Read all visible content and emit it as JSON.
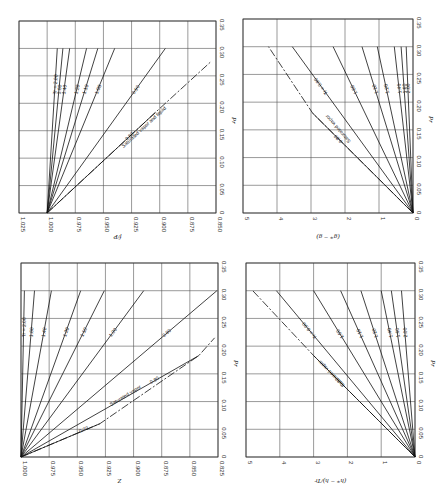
{
  "chart_data": [
    {
      "id": "fugacity",
      "type": "line",
      "orientation": "rotated-90",
      "box": {
        "x0": 19,
        "x1": 216,
        "y0": 21,
        "y1": 213
      },
      "value_axis": {
        "label": "f/P",
        "ticks": [
          "1.025",
          "1.000",
          "0.975",
          "0.950",
          "0.925",
          "0.900",
          "0.875",
          "0.850"
        ],
        "range": [
          1.025,
          0.85
        ]
      },
      "pressure_axis": {
        "label": "Pr",
        "ticks": [
          "0",
          "0.05",
          "0.10",
          "0.15",
          "0.20",
          "0.25",
          "0.30",
          "0.35"
        ],
        "range": [
          0,
          0.35
        ]
      },
      "series": [
        {
          "name": "Tr = 2.00",
          "end": [
            0.3,
            0.991
          ]
        },
        {
          "name": "1.60",
          "end": [
            0.3,
            0.986
          ]
        },
        {
          "name": "1.40",
          "end": [
            0.3,
            0.98
          ]
        },
        {
          "name": "1.20",
          "end": [
            0.3,
            0.965
          ]
        },
        {
          "name": "1.10",
          "end": [
            0.3,
            0.955
          ]
        },
        {
          "name": "1.00",
          "end": [
            0.3,
            0.94
          ]
        },
        {
          "name": "0.90",
          "end": [
            0.3,
            0.895
          ]
        },
        {
          "name": "0.80",
          "end": [
            0.183,
            0.904
          ]
        }
      ],
      "saturation": {
        "name": "Saturated vapor and liquid",
        "points": [
          [
            0,
            1.0
          ],
          [
            0.183,
            0.904
          ],
          [
            0.275,
            0.855
          ]
        ]
      }
    },
    {
      "id": "free-energy",
      "type": "line",
      "orientation": "rotated-90",
      "box": {
        "x0": 243,
        "x1": 413,
        "y0": 19,
        "y1": 213
      },
      "value_axis": {
        "label": "(g* − g)",
        "ticks": [
          "5",
          "4",
          "3",
          "2",
          "1",
          "0"
        ],
        "range": [
          5,
          0
        ]
      },
      "pressure_axis": {
        "label": "Pr",
        "ticks": [
          "0",
          "0.05",
          "0.10",
          "0.15",
          "0.20",
          "0.25",
          "0.30",
          "0.35"
        ],
        "range": [
          0,
          0.35
        ]
      },
      "series": [
        {
          "name": "2.00",
          "end": [
            0.3,
            0.2
          ]
        },
        {
          "name": "1.60",
          "end": [
            0.3,
            0.35
          ]
        },
        {
          "name": "1.40",
          "end": [
            0.3,
            0.55
          ]
        },
        {
          "name": "1.20",
          "end": [
            0.3,
            1.05
          ]
        },
        {
          "name": "1.10",
          "end": [
            0.3,
            1.5
          ]
        },
        {
          "name": "1.00",
          "end": [
            0.3,
            2.35
          ]
        },
        {
          "name": "Tr = 0.90",
          "end": [
            0.3,
            3.55
          ]
        },
        {
          "name": "0.80",
          "end": [
            0.18,
            2.95
          ]
        }
      ],
      "saturation": {
        "name": "Saturated vapor",
        "points": [
          [
            0,
            0
          ],
          [
            0.18,
            2.95
          ],
          [
            0.3,
            4.25
          ]
        ]
      }
    },
    {
      "id": "compressibility",
      "type": "line",
      "orientation": "rotated-90",
      "box": {
        "x0": 21,
        "x1": 218,
        "y0": 263,
        "y1": 457
      },
      "value_axis": {
        "label": "Z",
        "ticks": [
          "1.000",
          "0.975",
          "0.950",
          "0.925",
          "0.900",
          "0.875",
          "0.850",
          "0.825"
        ],
        "range": [
          1.0,
          0.825
        ]
      },
      "pressure_axis": {
        "label": "Pr",
        "ticks": [
          "0",
          "0.05",
          "0.10",
          "0.15",
          "0.20",
          "0.25",
          "0.30",
          "0.35"
        ],
        "range": [
          0,
          0.35
        ]
      },
      "series": [
        {
          "name": "Tr = 2.00",
          "end": [
            0.3,
            0.997
          ]
        },
        {
          "name": "1.60",
          "end": [
            0.3,
            0.988
          ]
        },
        {
          "name": "1.40",
          "end": [
            0.3,
            0.973
          ]
        },
        {
          "name": "1.20",
          "end": [
            0.3,
            0.947
          ]
        },
        {
          "name": "1.10",
          "end": [
            0.3,
            0.926
          ]
        },
        {
          "name": "1.00",
          "end": [
            0.3,
            0.891
          ]
        },
        {
          "name": "0.90",
          "end": [
            0.3,
            0.826
          ]
        },
        {
          "name": "0.80",
          "end": [
            0.183,
            0.842
          ]
        },
        {
          "name": "0.70",
          "end": [
            0.06,
            0.93
          ]
        }
      ],
      "saturation": {
        "name": "Saturated vapor",
        "points": [
          [
            0,
            1.0
          ],
          [
            0.06,
            0.93
          ],
          [
            0.183,
            0.842
          ],
          [
            0.215,
            0.828
          ]
        ]
      }
    },
    {
      "id": "enthalpy",
      "type": "line",
      "orientation": "rotated-90",
      "box": {
        "x0": 246,
        "x1": 415,
        "y0": 263,
        "y1": 457
      },
      "value_axis": {
        "label": "(h* − h)/Tr",
        "ticks": [
          "5",
          "4",
          "3",
          "2",
          "1",
          "0"
        ],
        "range": [
          5,
          0
        ]
      },
      "pressure_axis": {
        "label": "Pr",
        "ticks": [
          "0",
          "0.05",
          "0.10",
          "0.15",
          "0.20",
          "0.25",
          "0.30",
          "0.35"
        ],
        "range": [
          0,
          0.35
        ]
      },
      "series": [
        {
          "name": "2.00",
          "end": [
            0.3,
            0.4
          ]
        },
        {
          "name": "1.60",
          "end": [
            0.3,
            0.7
          ]
        },
        {
          "name": "1.40",
          "end": [
            0.3,
            1.0
          ]
        },
        {
          "name": "1.20",
          "end": [
            0.3,
            1.6
          ]
        },
        {
          "name": "1.10",
          "end": [
            0.3,
            2.2
          ]
        },
        {
          "name": "1.00",
          "end": [
            0.3,
            3.0
          ]
        },
        {
          "name": "Tr = 0.90",
          "end": [
            0.3,
            4.1
          ]
        },
        {
          "name": "0.80",
          "end": [
            0.183,
            3.0
          ]
        }
      ],
      "saturation": {
        "name": "Saturated vapor",
        "points": [
          [
            0,
            0
          ],
          [
            0.183,
            3.0
          ],
          [
            0.3,
            4.8
          ]
        ]
      }
    }
  ]
}
